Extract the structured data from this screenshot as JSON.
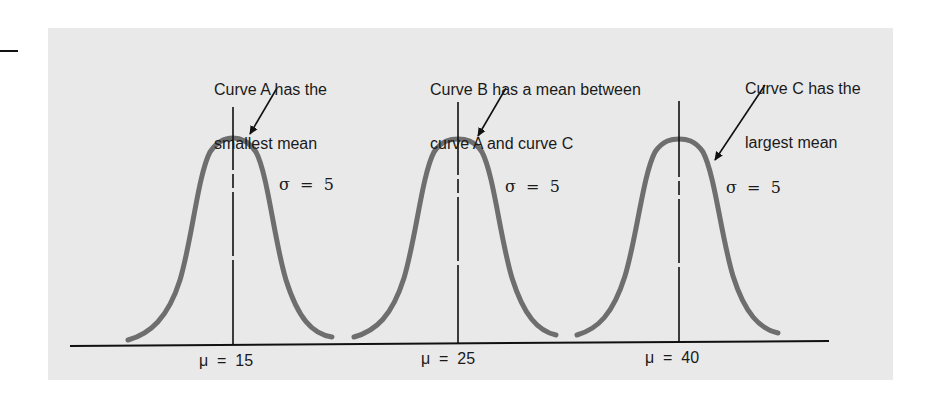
{
  "annotations": [
    {
      "id": "A",
      "line1": "Curve A has the",
      "line2": "smallest mean"
    },
    {
      "id": "B",
      "line1": "Curve B has a mean between",
      "line2": "curve A and curve C"
    },
    {
      "id": "C",
      "line1": "Curve C has the",
      "line2": "largest mean"
    }
  ],
  "curves": [
    {
      "id": "A",
      "mean_label": "μ  =  15",
      "sigma_label": "σ  =  5",
      "mean": 15,
      "sigma": 5
    },
    {
      "id": "B",
      "mean_label": "μ  =  25",
      "sigma_label": "σ  =  5",
      "mean": 25,
      "sigma": 5
    },
    {
      "id": "C",
      "mean_label": "μ  =  40",
      "sigma_label": "σ  =  5",
      "mean": 40,
      "sigma": 5
    }
  ],
  "colors": {
    "panel": "#e9e9e9",
    "curve": "#6e6e6e",
    "line": "#111111"
  }
}
